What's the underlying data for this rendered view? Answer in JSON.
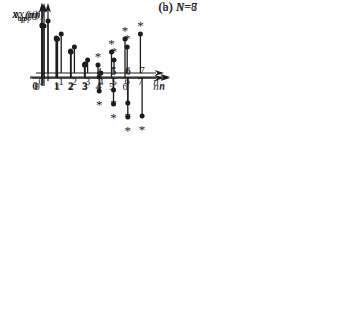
{
  "figure": {
    "background": "#ffffff",
    "ink": "#1c1c1c"
  },
  "captions": {
    "a": {
      "prefix": "(a) ",
      "var": "N",
      "rest": "=8"
    },
    "b": {
      "prefix": "(b) ",
      "var": "N",
      "rest": "=7"
    }
  },
  "chart_data": [
    {
      "type": "stem",
      "id": "xep-n8",
      "title": "even periodic component, N=8",
      "ylabel": {
        "base": "x",
        "sub": "ep",
        "arg": "(n)"
      },
      "xlabel": "n",
      "N": 8,
      "x": [
        0,
        1,
        2,
        3,
        4,
        5,
        6,
        7
      ],
      "y": [
        4,
        3,
        2,
        1,
        0,
        1,
        2,
        3
      ],
      "starred_x": [
        5,
        6,
        7
      ],
      "star_side": "above",
      "marker": "*",
      "ylim": [
        0,
        4.5
      ],
      "grid": false
    },
    {
      "type": "stem",
      "id": "xop-n8",
      "title": "odd periodic component, N=8",
      "ylabel": {
        "base": "x",
        "sub": "op",
        "arg": "(n)"
      },
      "xlabel": "n",
      "N": 8,
      "x": [
        0,
        1,
        2,
        3,
        4,
        5,
        6,
        7
      ],
      "y": [
        4,
        3,
        2,
        1,
        0,
        -1,
        -2,
        -3
      ],
      "starred_x": [
        5,
        6,
        7
      ],
      "star_side": "below",
      "marker": "*",
      "ylim": [
        -3.5,
        4.5
      ],
      "grid": false
    },
    {
      "type": "stem",
      "id": "xep-n7",
      "title": "even periodic component, N=7",
      "ylabel": {
        "base": "x",
        "sub": "ep",
        "arg": "(n)"
      },
      "xlabel": "n",
      "N": 7,
      "x": [
        0,
        1,
        2,
        3,
        4,
        5,
        6
      ],
      "y": [
        4,
        3,
        2,
        1,
        1,
        2,
        3
      ],
      "starred_x": [
        4,
        5,
        6
      ],
      "star_side": "above",
      "marker": "*",
      "ylim": [
        0,
        4.5
      ],
      "grid": false
    },
    {
      "type": "stem",
      "id": "xop-n7",
      "title": "odd periodic component, N=7",
      "ylabel": {
        "base": "x",
        "sub": "op",
        "arg": "(n)"
      },
      "xlabel": "n",
      "N": 7,
      "x": [
        0,
        1,
        2,
        3,
        4,
        5,
        6
      ],
      "y": [
        4,
        3,
        2,
        1,
        -1,
        -2,
        -3
      ],
      "starred_x": [
        4,
        5,
        6
      ],
      "star_side": "below",
      "marker": "*",
      "ylim": [
        -3.5,
        4.5
      ],
      "grid": false
    }
  ]
}
